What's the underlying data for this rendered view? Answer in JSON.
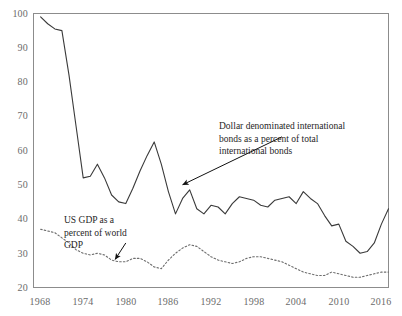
{
  "chart_data": {
    "type": "line",
    "title": "",
    "subtitle": "",
    "xlabel": "",
    "ylabel": "",
    "xlim": [
      1967,
      2017
    ],
    "ylim": [
      20,
      100
    ],
    "grid": false,
    "legend_position": "none",
    "x_tick_labels": [
      "1968",
      "1974",
      "1980",
      "1986",
      "1992",
      "1998",
      "2004",
      "2010",
      "2016"
    ],
    "x_ticks": [
      1968,
      1974,
      1980,
      1986,
      1992,
      1998,
      2004,
      2010,
      2016
    ],
    "y_tick_labels": [
      "20",
      "30",
      "40",
      "50",
      "60",
      "70",
      "80",
      "90",
      "100"
    ],
    "y_ticks": [
      20,
      30,
      40,
      50,
      60,
      70,
      80,
      90,
      100
    ],
    "series": [
      {
        "name": "Dollar denominated international bonds as a percent of total international bonds",
        "style": "solid",
        "color": "#3a3a3a",
        "x": [
          1968,
          1969,
          1970,
          1971,
          1972,
          1973,
          1974,
          1975,
          1976,
          1977,
          1978,
          1979,
          1980,
          1981,
          1982,
          1983,
          1984,
          1985,
          1986,
          1987,
          1988,
          1989,
          1990,
          1991,
          1992,
          1993,
          1994,
          1995,
          1996,
          1997,
          1998,
          1999,
          2000,
          2001,
          2002,
          2003,
          2004,
          2005,
          2006,
          2007,
          2008,
          2009,
          2010,
          2011,
          2012,
          2013,
          2014,
          2015,
          2016,
          2017
        ],
        "values": [
          99,
          97,
          95.5,
          95,
          82,
          67,
          52,
          52.5,
          56,
          52,
          47,
          45,
          44.5,
          49,
          54,
          58.5,
          62.5,
          56,
          48,
          41.5,
          46,
          48.5,
          43,
          41.5,
          44,
          43.5,
          41.5,
          44.5,
          46.5,
          46,
          45.5,
          44,
          43.5,
          45.5,
          46,
          46.5,
          44.5,
          48,
          46,
          44.5,
          41,
          38,
          38.5,
          33.5,
          32,
          30,
          30.5,
          33,
          38.5,
          43
        ]
      },
      {
        "name": "US GDP as a percent of world GDP",
        "style": "dashed",
        "color": "#6e6e6e",
        "x": [
          1968,
          1969,
          1970,
          1971,
          1972,
          1973,
          1974,
          1975,
          1976,
          1977,
          1978,
          1979,
          1980,
          1981,
          1982,
          1983,
          1984,
          1985,
          1986,
          1987,
          1988,
          1989,
          1990,
          1991,
          1992,
          1993,
          1994,
          1995,
          1996,
          1997,
          1998,
          1999,
          2000,
          2001,
          2002,
          2003,
          2004,
          2005,
          2006,
          2007,
          2008,
          2009,
          2010,
          2011,
          2012,
          2013,
          2014,
          2015,
          2016,
          2017
        ],
        "values": [
          37,
          36.5,
          36,
          34.5,
          33,
          31,
          30,
          29.5,
          30,
          29.5,
          28,
          27.5,
          27.5,
          28.5,
          28.5,
          27.5,
          26,
          25.5,
          28,
          30,
          31.5,
          32.5,
          32,
          30.5,
          29,
          28,
          27.5,
          27,
          27.5,
          28.5,
          29,
          29,
          28.5,
          28,
          27.5,
          26.5,
          25.5,
          24.5,
          24,
          23.5,
          23.5,
          24.5,
          24,
          23.5,
          23,
          23,
          23.5,
          24,
          24.5,
          24.5
        ]
      }
    ],
    "annotations": [
      {
        "id": "bonds",
        "text": "Dollar denominated international\nbonds as a percent of total\ninternational bonds",
        "arrow_from": [
          2002,
          64
        ],
        "arrow_to": [
          1988,
          50
        ]
      },
      {
        "id": "usgdp",
        "text": "US GDP as a\npercent of world\nGDP",
        "arrow_from": [
          1980,
          33
        ],
        "arrow_to": [
          1978.5,
          28.2
        ]
      }
    ]
  },
  "axes": {
    "frame_color": "#8c8c8c"
  }
}
